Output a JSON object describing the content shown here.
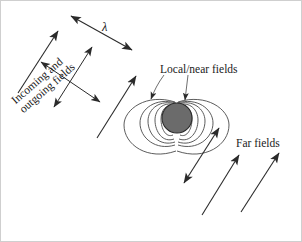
{
  "figure": {
    "width": 302,
    "height": 242,
    "background_color": "#ffffff",
    "border_color": "#cfcfcf"
  },
  "labels": {
    "local_near_fields": "Local/near fields",
    "far_fields": "Far fields",
    "incoming_outgoing_fields": "Incoming and\noutgoing fields",
    "incoming_outgoing_line1": "Incoming and",
    "incoming_outgoing_line2": "outgoing fields",
    "wavelength_symbol": "λ"
  },
  "colors": {
    "stroke": "#3a3a3a",
    "field_line": "#4a4a4a",
    "sphere_fill": "#6b6b6b",
    "sphere_stroke": "#2a2a2a",
    "text": "#1a1a1a",
    "arrow": "#2b2b2b"
  },
  "elements": {
    "sphere": {
      "cx": 176,
      "cy": 117,
      "r": 15,
      "description": "oscillating-dipole-source"
    },
    "wavelength_arrow": {
      "x1": 68,
      "y1": 13,
      "x2": 133,
      "y2": 50,
      "double_headed": true,
      "label": "λ"
    },
    "far_field_arrows": [
      {
        "x1": 182,
        "y1": 183,
        "x2": 219,
        "y2": 125,
        "heads": "start-end"
      },
      {
        "x1": 200,
        "y1": 215,
        "x2": 239,
        "y2": 152,
        "heads": "end"
      },
      {
        "x1": 239,
        "y1": 212,
        "x2": 279,
        "y2": 150,
        "heads": "end"
      }
    ],
    "incoming_outgoing_arrows": [
      {
        "x1": 17,
        "y1": 92,
        "x2": 58,
        "y2": 29,
        "heads": "end"
      },
      {
        "x1": 96,
        "y1": 137,
        "x2": 136,
        "y2": 74,
        "heads": "end"
      },
      {
        "x1": 38,
        "y1": 60,
        "x2": 100,
        "y2": 102,
        "heads": "both"
      },
      {
        "x1": 92,
        "y1": 45,
        "x2": 52,
        "y2": 107,
        "heads": "both"
      }
    ],
    "pointer_lines": [
      {
        "from": "local-label",
        "x1": 161,
        "y1": 74,
        "x2": 152,
        "y2": 97
      },
      {
        "from": "local-label",
        "x1": 186,
        "y1": 74,
        "x2": 183,
        "y2": 99
      }
    ],
    "dipole_field_lines_count": 12
  }
}
